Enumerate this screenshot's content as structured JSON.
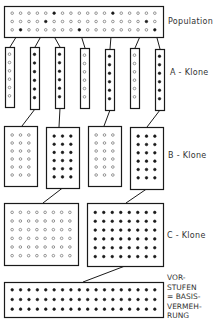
{
  "labels": {
    "population": "Population",
    "a_clones": "A - Klone",
    "b_clones": "B - Klone",
    "c_clones": "C - Klone",
    "vorstufen": "VOR-\nSTUFEN\n= BASIS-\nVERMEH-\nRUNG"
  },
  "colors": {
    "stroke": "#1a1a1a",
    "background": "#ffffff"
  },
  "population": {
    "box": [
      4,
      6,
      159,
      31
    ],
    "rows": 3,
    "cols": 18,
    "selected": [
      [
        0,
        5,
        1
      ],
      [
        0,
        12,
        4
      ],
      [
        1,
        4,
        2
      ],
      [
        1,
        16,
        5
      ],
      [
        2,
        1,
        0
      ],
      [
        2,
        8,
        3
      ],
      [
        2,
        17,
        6
      ]
    ]
  },
  "a_clones": {
    "columns": [
      {
        "x": 5,
        "y": 47,
        "w": 9,
        "h": 60,
        "filled": false
      },
      {
        "x": 30,
        "y": 47,
        "w": 9,
        "h": 62,
        "filled": true
      },
      {
        "x": 55,
        "y": 47,
        "w": 9,
        "h": 61,
        "filled": true
      },
      {
        "x": 80,
        "y": 48,
        "w": 9,
        "h": 60,
        "filled": false
      },
      {
        "x": 105,
        "y": 49,
        "w": 9,
        "h": 61,
        "filled": true
      },
      {
        "x": 130,
        "y": 48,
        "w": 9,
        "h": 60,
        "filled": false
      },
      {
        "x": 155,
        "y": 49,
        "w": 9,
        "h": 61,
        "filled": true
      }
    ],
    "dots_per_column": 6
  },
  "b_clones": {
    "boxes": [
      {
        "x": 4,
        "y": 126,
        "w": 33,
        "h": 60,
        "filled": false
      },
      {
        "x": 46,
        "y": 127,
        "w": 33,
        "h": 61,
        "filled": true,
        "from_a": 1
      },
      {
        "x": 88,
        "y": 126,
        "w": 33,
        "h": 60,
        "filled": false
      },
      {
        "x": 130,
        "y": 127,
        "w": 33,
        "h": 62,
        "filled": true,
        "from_a": 6
      }
    ],
    "from_a": [
      1,
      2,
      4,
      6
    ],
    "rows": 6,
    "cols": 3
  },
  "c_clones": {
    "boxes": [
      {
        "x": 4,
        "y": 203,
        "w": 74,
        "h": 62,
        "filled": false
      },
      {
        "x": 87,
        "y": 203,
        "w": 76,
        "h": 63,
        "filled": true
      }
    ],
    "from_b": [
      1,
      3
    ],
    "rows": 6,
    "cols": 8
  },
  "vorstufen": {
    "box": [
      4,
      282,
      159,
      35
    ],
    "rows": 3,
    "cols": 18,
    "from_c": 1
  }
}
